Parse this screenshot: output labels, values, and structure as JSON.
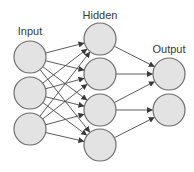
{
  "diagram": {
    "colors": {
      "node_fill": "#e3e3e3",
      "node_stroke": "#6e6e6e",
      "edge": "#4a4a4a",
      "label": "#3a3a3a"
    },
    "node_radius": 16,
    "layers": [
      {
        "id": "input",
        "label": "Input",
        "label_pos": {
          "x": 30,
          "y": 35
        },
        "nodes": [
          {
            "id": "i1",
            "x": 30,
            "y": 57
          },
          {
            "id": "i2",
            "x": 30,
            "y": 93
          },
          {
            "id": "i3",
            "x": 30,
            "y": 129
          }
        ]
      },
      {
        "id": "hidden",
        "label": "Hidden",
        "label_pos": {
          "x": 100,
          "y": 19
        },
        "nodes": [
          {
            "id": "h1",
            "x": 100,
            "y": 39
          },
          {
            "id": "h2",
            "x": 100,
            "y": 74
          },
          {
            "id": "h3",
            "x": 100,
            "y": 110
          },
          {
            "id": "h4",
            "x": 100,
            "y": 145
          }
        ]
      },
      {
        "id": "output",
        "label": "Output",
        "label_pos": {
          "x": 169,
          "y": 53
        },
        "nodes": [
          {
            "id": "o1",
            "x": 169,
            "y": 74
          },
          {
            "id": "o2",
            "x": 169,
            "y": 110
          }
        ]
      }
    ],
    "edges": [
      {
        "from": "i1",
        "to": "h1"
      },
      {
        "from": "i1",
        "to": "h2"
      },
      {
        "from": "i1",
        "to": "h3"
      },
      {
        "from": "i1",
        "to": "h4"
      },
      {
        "from": "i2",
        "to": "h1"
      },
      {
        "from": "i2",
        "to": "h2"
      },
      {
        "from": "i2",
        "to": "h3"
      },
      {
        "from": "i2",
        "to": "h4"
      },
      {
        "from": "i3",
        "to": "h1"
      },
      {
        "from": "i3",
        "to": "h2"
      },
      {
        "from": "i3",
        "to": "h3"
      },
      {
        "from": "i3",
        "to": "h4"
      },
      {
        "from": "h1",
        "to": "o1"
      },
      {
        "from": "h2",
        "to": "o1"
      },
      {
        "from": "h3",
        "to": "o1"
      },
      {
        "from": "h3",
        "to": "o2"
      },
      {
        "from": "h4",
        "to": "o2"
      }
    ]
  }
}
